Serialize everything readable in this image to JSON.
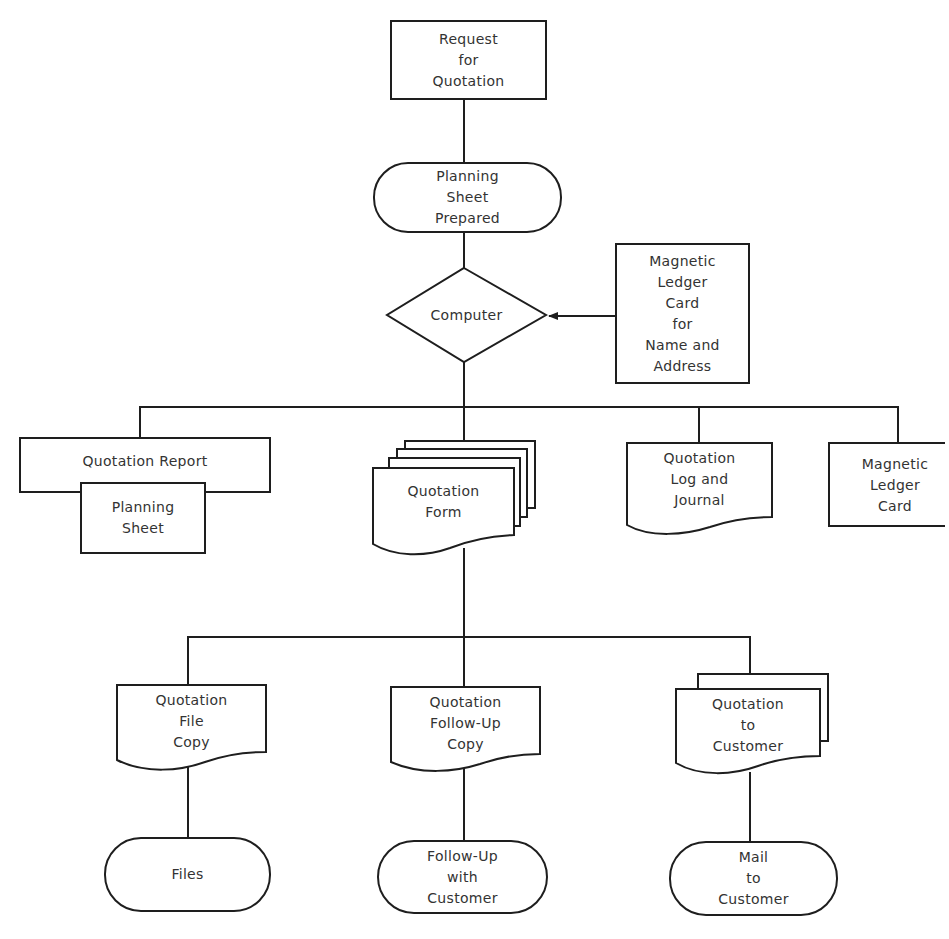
{
  "diagram": {
    "type": "flowchart",
    "line_color": "#1e1e1e",
    "background": "#ffffff",
    "nodes": {
      "request": {
        "shape": "process",
        "lines": [
          "Request",
          "for",
          "Quotation"
        ]
      },
      "planning_prepared": {
        "shape": "terminal",
        "lines": [
          "Planning",
          "Sheet",
          "Prepared"
        ]
      },
      "computer": {
        "shape": "decision",
        "lines": [
          "Computer"
        ]
      },
      "ledger_input": {
        "shape": "process",
        "lines": [
          "Magnetic",
          "Ledger",
          "Card",
          "for",
          "Name and",
          "Address"
        ]
      },
      "quotation_report": {
        "shape": "process",
        "lines": [
          "Quotation Report"
        ]
      },
      "planning_sheet": {
        "shape": "process",
        "lines": [
          "Planning",
          "Sheet"
        ]
      },
      "quotation_form": {
        "shape": "multi-document",
        "lines": [
          "Quotation",
          "Form"
        ]
      },
      "log_journal": {
        "shape": "document",
        "lines": [
          "Quotation",
          "Log and",
          "Journal"
        ]
      },
      "ledger_card": {
        "shape": "process",
        "lines": [
          "Magnetic",
          "Ledger",
          "Card"
        ]
      },
      "file_copy": {
        "shape": "document",
        "lines": [
          "Quotation",
          "File",
          "Copy"
        ]
      },
      "followup_copy": {
        "shape": "document",
        "lines": [
          "Quotation",
          "Follow-Up",
          "Copy"
        ]
      },
      "to_customer": {
        "shape": "multi-document",
        "lines": [
          "Quotation",
          "to",
          "Customer"
        ]
      },
      "files": {
        "shape": "terminal",
        "lines": [
          "Files"
        ]
      },
      "followup_customer": {
        "shape": "terminal",
        "lines": [
          "Follow-Up",
          "with",
          "Customer"
        ]
      },
      "mail_customer": {
        "shape": "terminal",
        "lines": [
          "Mail",
          "to",
          "Customer"
        ]
      }
    },
    "edges": [
      [
        "Request for Quotation",
        "Planning Sheet Prepared"
      ],
      [
        "Planning Sheet Prepared",
        "Computer"
      ],
      [
        "Magnetic Ledger Card for Name and Address",
        "Computer"
      ],
      [
        "Computer",
        "Quotation Report"
      ],
      [
        "Computer",
        "Quotation Form"
      ],
      [
        "Computer",
        "Quotation Log and Journal"
      ],
      [
        "Computer",
        "Magnetic Ledger Card"
      ],
      [
        "Quotation Form",
        "Quotation File Copy"
      ],
      [
        "Quotation Form",
        "Quotation Follow-Up Copy"
      ],
      [
        "Quotation Form",
        "Quotation to Customer"
      ],
      [
        "Quotation File Copy",
        "Files"
      ],
      [
        "Quotation Follow-Up Copy",
        "Follow-Up with Customer"
      ],
      [
        "Quotation to Customer",
        "Mail to Customer"
      ]
    ]
  }
}
